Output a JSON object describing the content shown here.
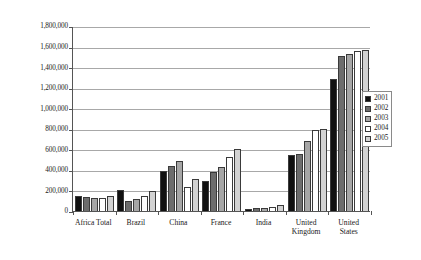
{
  "chart_data": {
    "type": "bar",
    "title": "",
    "subtitle": "",
    "xlabel": "",
    "ylabel": "",
    "grid": true,
    "legend_position": "right",
    "ylim": [
      0,
      1800000
    ],
    "ytick_step": 200000,
    "categories": [
      "Africa Total",
      "Brazil",
      "China",
      "France",
      "India",
      "United Kingdom",
      "United States"
    ],
    "category_labels": [
      "Africa Total",
      "Brazil",
      "China",
      "France",
      "India",
      "United\nKingdom",
      "United\nStates"
    ],
    "ytick_labels": [
      "1,800,000",
      "1,600,000",
      "1,400,000",
      "1,200,000",
      "1,000,000",
      "800,000",
      "600,000",
      "400,000",
      "200,000",
      "0"
    ],
    "ytick_values": [
      1800000,
      1600000,
      1400000,
      1200000,
      1000000,
      800000,
      600000,
      400000,
      200000,
      0
    ],
    "series": [
      {
        "name": "2001",
        "color": "#111111",
        "values": [
          145000,
          205000,
          390000,
          290000,
          15000,
          545000,
          1280000
        ]
      },
      {
        "name": "2002",
        "color": "#6d6d6d",
        "values": [
          135000,
          95000,
          440000,
          375000,
          25000,
          550000,
          1510000
        ]
      },
      {
        "name": "2003",
        "color": "#a6a6a6",
        "values": [
          125000,
          115000,
          485000,
          425000,
          30000,
          680000,
          1525000
        ]
      },
      {
        "name": "2004",
        "color": "#ffffff",
        "values": [
          130000,
          145000,
          230000,
          530000,
          40000,
          790000,
          1560000
        ]
      },
      {
        "name": "2005",
        "color": "#d2d2d2",
        "values": [
          150000,
          195000,
          310000,
          600000,
          55000,
          795000,
          1565000
        ]
      }
    ]
  },
  "legend": {
    "items": [
      {
        "label": "2001"
      },
      {
        "label": "2002"
      },
      {
        "label": "2003"
      },
      {
        "label": "2004"
      },
      {
        "label": "2005"
      }
    ]
  }
}
